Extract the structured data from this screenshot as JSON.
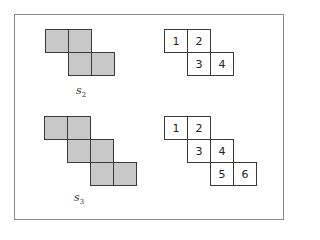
{
  "figures": [
    {
      "label": "s",
      "subscript": "2",
      "shaded_cells": [
        [
          0,
          0
        ],
        [
          1,
          0
        ],
        [
          1,
          1
        ],
        [
          2,
          1
        ]
      ],
      "numbered_cells": [
        {
          "col": 0,
          "row": 0,
          "n": "1"
        },
        {
          "col": 1,
          "row": 0,
          "n": "2"
        },
        {
          "col": 1,
          "row": 1,
          "n": "3"
        },
        {
          "col": 2,
          "row": 1,
          "n": "4"
        }
      ]
    },
    {
      "label": "s",
      "subscript": "3",
      "shaded_cells": [
        [
          0,
          0
        ],
        [
          1,
          0
        ],
        [
          1,
          1
        ],
        [
          2,
          1
        ],
        [
          2,
          2
        ],
        [
          3,
          2
        ]
      ],
      "numbered_cells": [
        {
          "col": 0,
          "row": 0,
          "n": "1"
        },
        {
          "col": 1,
          "row": 0,
          "n": "2"
        },
        {
          "col": 1,
          "row": 1,
          "n": "3"
        },
        {
          "col": 2,
          "row": 1,
          "n": "4"
        },
        {
          "col": 2,
          "row": 2,
          "n": "5"
        },
        {
          "col": 3,
          "row": 2,
          "n": "6"
        }
      ]
    }
  ],
  "colors": {
    "shade": "#c8c8c8",
    "border": "#3a3a3a",
    "frame": "#8a8a8a"
  }
}
